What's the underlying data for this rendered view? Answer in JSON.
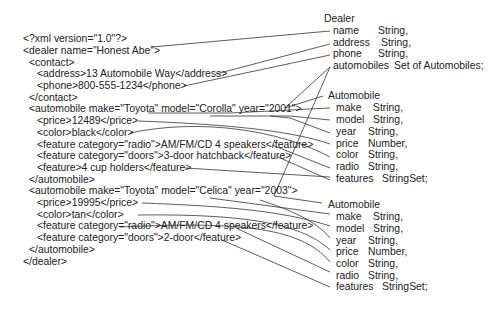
{
  "xml_document": {
    "lines": [
      {
        "indent": 0,
        "text": "<?xml version=\"1.0\"?>"
      },
      {
        "indent": 0,
        "text": "<dealer name=\"Honest Abe\">"
      },
      {
        "indent": 1,
        "text": "<contact>"
      },
      {
        "indent": 2,
        "text": "<address>13 Automobile Way</address>"
      },
      {
        "indent": 2,
        "text": "<phone>800-555-1234</phone>"
      },
      {
        "indent": 1,
        "text": "</contact>"
      },
      {
        "indent": 1,
        "text": "<automobile make=\"Toyota\" model=\"Corolla\" year=\"2001\">"
      },
      {
        "indent": 2,
        "text": "<price>12489</price>"
      },
      {
        "indent": 2,
        "text": "<color>black</color>"
      },
      {
        "indent": 2,
        "text": "<feature category=\"radio\">AM/FM/CD 4 speakers</feature>"
      },
      {
        "indent": 2,
        "text": "<feature category=\"doors\">3-door hatchback</feature>"
      },
      {
        "indent": 2,
        "text": "<feature>4 cup holders</feature>"
      },
      {
        "indent": 1,
        "text": "</automobile>"
      },
      {
        "indent": 1,
        "text": "<automobile make=\"Toyota\" model=\"Celica\" year=\"2003\">"
      },
      {
        "indent": 2,
        "text": "<price>19995</price>"
      },
      {
        "indent": 2,
        "text": "<color>tan</color>"
      },
      {
        "indent": 2,
        "text": "<feature category=\"radio\">AM/FM/CD 4 speakers</feature>"
      },
      {
        "indent": 2,
        "text": "<feature category=\"doors\">2-door</feature>"
      },
      {
        "indent": 1,
        "text": "</automobile>"
      },
      {
        "indent": 0,
        "text": "</dealer>"
      }
    ]
  },
  "schema": {
    "dealer": {
      "title": "Dealer",
      "fields": [
        {
          "name": "name",
          "type": "String,"
        },
        {
          "name": "address",
          "type": "String,"
        },
        {
          "name": "phone",
          "type": "String,"
        },
        {
          "name": "automobiles",
          "type": "Set of Automobiles;"
        }
      ]
    },
    "automobile_1": {
      "title": "Automobile",
      "fields": [
        {
          "name": "make",
          "type": "String,"
        },
        {
          "name": "model",
          "type": "String,"
        },
        {
          "name": "year",
          "type": "String,"
        },
        {
          "name": "price",
          "type": "Number,"
        },
        {
          "name": "color",
          "type": "String,"
        },
        {
          "name": "radio",
          "type": "String,"
        },
        {
          "name": "features",
          "type": "StringSet;"
        }
      ]
    },
    "automobile_2": {
      "title": "Automobile",
      "fields": [
        {
          "name": "make",
          "type": "String,"
        },
        {
          "name": "model",
          "type": "String,"
        },
        {
          "name": "year",
          "type": "String,"
        },
        {
          "name": "price",
          "type": "Number,"
        },
        {
          "name": "color",
          "type": "String,"
        },
        {
          "name": "radio",
          "type": "String,"
        },
        {
          "name": "features",
          "type": "StringSet;"
        }
      ]
    }
  }
}
